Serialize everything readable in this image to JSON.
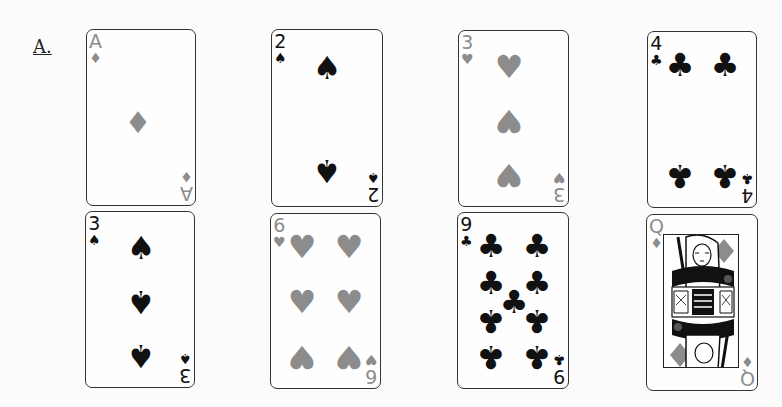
{
  "figure_label": "A.",
  "colors": {
    "red_suit": "#8c8c8c",
    "black_suit": "#111111",
    "card_border": "#333333"
  },
  "cards": [
    {
      "rank": "A",
      "suit": "diamonds",
      "suit_glyph": "♦",
      "color": "red",
      "row": 1,
      "col": 1
    },
    {
      "rank": "2",
      "suit": "spades",
      "suit_glyph": "♠",
      "color": "black",
      "row": 1,
      "col": 2
    },
    {
      "rank": "3",
      "suit": "hearts",
      "suit_glyph": "♥",
      "color": "red",
      "row": 1,
      "col": 3
    },
    {
      "rank": "4",
      "suit": "clubs",
      "suit_glyph": "♣",
      "color": "black",
      "row": 1,
      "col": 4
    },
    {
      "rank": "3",
      "suit": "spades",
      "suit_glyph": "♠",
      "color": "black",
      "row": 2,
      "col": 1
    },
    {
      "rank": "6",
      "suit": "hearts",
      "suit_glyph": "♥",
      "color": "red",
      "row": 2,
      "col": 2
    },
    {
      "rank": "9",
      "suit": "clubs",
      "suit_glyph": "♣",
      "color": "black",
      "row": 2,
      "col": 3
    },
    {
      "rank": "Q",
      "suit": "diamonds",
      "suit_glyph": "♦",
      "color": "red",
      "row": 2,
      "col": 4
    }
  ]
}
